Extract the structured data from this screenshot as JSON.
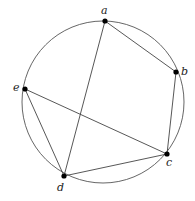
{
  "diagram": {
    "type": "inscribed-pentagon-graph",
    "circle": {
      "cx": 103,
      "cy": 102,
      "r": 81,
      "stroke": "#555555"
    },
    "points": [
      {
        "id": "a",
        "label": "a",
        "x": 105,
        "y": 21,
        "lx": 101,
        "ly": 14
      },
      {
        "id": "b",
        "label": "b",
        "x": 176,
        "y": 72,
        "lx": 181,
        "ly": 75
      },
      {
        "id": "c",
        "label": "c",
        "x": 167,
        "y": 154,
        "lx": 166,
        "ly": 166
      },
      {
        "id": "d",
        "label": "d",
        "x": 64,
        "y": 176,
        "lx": 57,
        "ly": 191
      },
      {
        "id": "e",
        "label": "e",
        "x": 25,
        "y": 89,
        "lx": 13,
        "ly": 91
      }
    ],
    "edges": [
      [
        "a",
        "b"
      ],
      [
        "b",
        "c"
      ],
      [
        "c",
        "d"
      ],
      [
        "d",
        "e"
      ],
      [
        "a",
        "d"
      ],
      [
        "e",
        "c"
      ]
    ],
    "edge_color": "#444444",
    "point_color": "#000000"
  }
}
